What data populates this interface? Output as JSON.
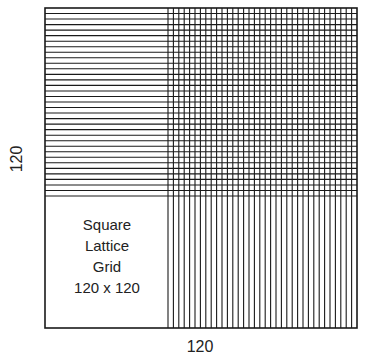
{
  "figure": {
    "title_lines": [
      "Square",
      "Lattice",
      "Grid",
      "120 x 120"
    ],
    "left_axis_label": "120",
    "bottom_axis_label": "120",
    "colors": {
      "line": "#1a1a1a",
      "background": "#ffffff",
      "text": "#222222"
    },
    "outer_box": {
      "x": 45,
      "y": 8,
      "width": 312,
      "height": 320
    },
    "horizontal_lines": {
      "count": 34,
      "y_start": 8,
      "y_end": 196,
      "x_start": 45,
      "x_end": 357
    },
    "vertical_lines": {
      "count": 35,
      "x_start": 168,
      "x_end": 357,
      "y_start": 8,
      "y_end": 328
    }
  }
}
